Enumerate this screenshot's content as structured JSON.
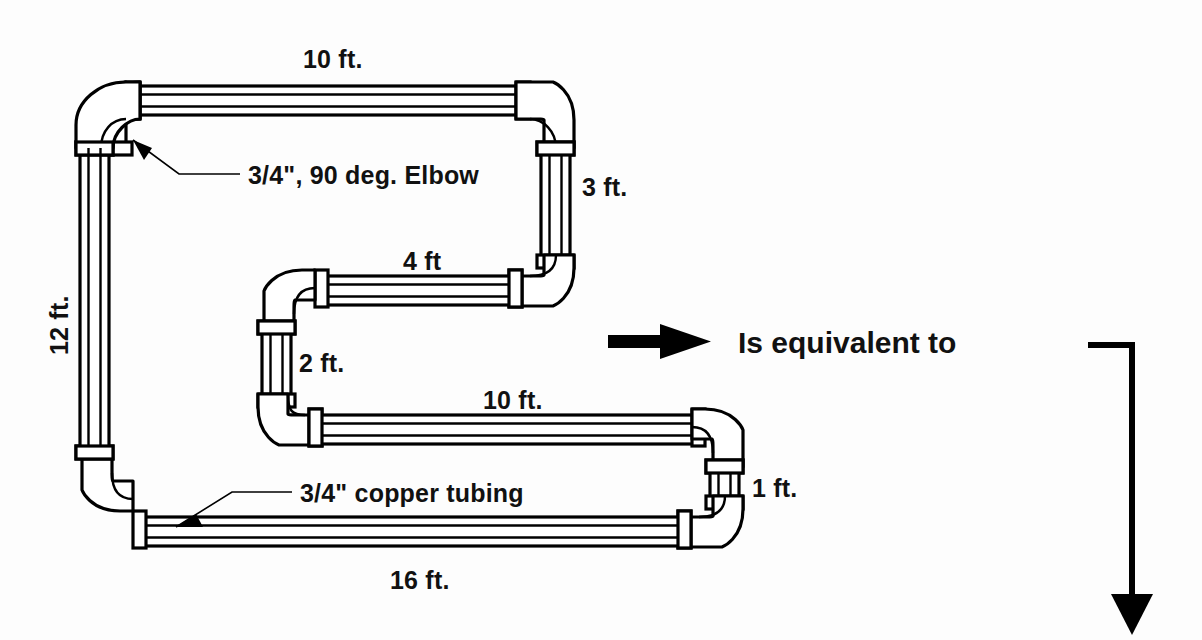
{
  "diagram": {
    "title_text": "Is equivalent to",
    "dimensions": {
      "top_run": "10 ft.",
      "left_run": "12 ft.",
      "right_upper_drop": "3 ft.",
      "mid_run": "4 ft",
      "mid_drop": "2 ft.",
      "lower_run": "10 ft.",
      "bottom_run": "16 ft.",
      "right_lower_drop": "1 ft."
    },
    "callouts": {
      "elbow": "3/4\", 90 deg. Elbow",
      "tubing": "3/4\" copper tubing"
    },
    "colors": {
      "line": "#000000",
      "fill": "#ffffff",
      "background": "#fdfdfd"
    },
    "icons": {
      "equivalence_arrow": "right-arrow-icon",
      "flow_arrow": "down-arrow-icon",
      "elbow_pointer": "arrow-pointer-icon",
      "tubing_pointer": "arrow-pointer-icon"
    }
  }
}
